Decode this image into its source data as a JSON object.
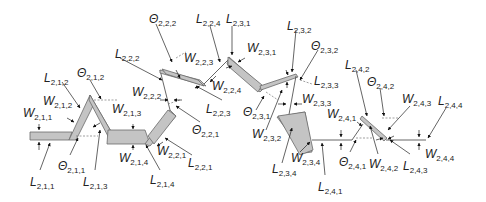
{
  "diagram": {
    "colors": {
      "segment_fill": "#c4c4c4",
      "segment_stroke": "#6a6a6a",
      "annotation": "#222222"
    },
    "labels": [
      {
        "id": "L211",
        "sym": "L",
        "sub": "2,1,1",
        "x": 30,
        "y": 176
      },
      {
        "id": "W211",
        "sym": "W",
        "sub": "2,1,1",
        "x": 23,
        "y": 107
      },
      {
        "id": "L212",
        "sym": "L",
        "sub": "2,1,2",
        "x": 44,
        "y": 72
      },
      {
        "id": "W212",
        "sym": "W",
        "sub": "2,1,2",
        "x": 43,
        "y": 95
      },
      {
        "id": "T212",
        "sym": "Θ",
        "sub": "2,1,2",
        "x": 77,
        "y": 67
      },
      {
        "id": "T211",
        "sym": "Θ",
        "sub": "2,1,1",
        "x": 58,
        "y": 160
      },
      {
        "id": "W213",
        "sym": "W",
        "sub": "2,1,3",
        "x": 112,
        "y": 103
      },
      {
        "id": "L213",
        "sym": "L",
        "sub": "2,1,3",
        "x": 83,
        "y": 176
      },
      {
        "id": "W214",
        "sym": "W",
        "sub": "2,1,4",
        "x": 119,
        "y": 152
      },
      {
        "id": "L214",
        "sym": "L",
        "sub": "2,1,4",
        "x": 150,
        "y": 174
      },
      {
        "id": "L222",
        "sym": "L",
        "sub": "2,2,2",
        "x": 115,
        "y": 48
      },
      {
        "id": "W222",
        "sym": "W",
        "sub": "2,2,2",
        "x": 132,
        "y": 86
      },
      {
        "id": "T222",
        "sym": "Θ",
        "sub": "2,2,2",
        "x": 149,
        "y": 13
      },
      {
        "id": "W223",
        "sym": "W",
        "sub": "2,2,3",
        "x": 184,
        "y": 52
      },
      {
        "id": "L224",
        "sym": "L",
        "sub": "2,2,4",
        "x": 196,
        "y": 13
      },
      {
        "id": "L231",
        "sym": "L",
        "sub": "2,3,1",
        "x": 226,
        "y": 13
      },
      {
        "id": "W224",
        "sym": "W",
        "sub": "2,2,4",
        "x": 212,
        "y": 80
      },
      {
        "id": "L223",
        "sym": "L",
        "sub": "2,2,3",
        "x": 206,
        "y": 103
      },
      {
        "id": "T221",
        "sym": "Θ",
        "sub": "2,2,1",
        "x": 192,
        "y": 124
      },
      {
        "id": "W221",
        "sym": "W",
        "sub": "2,2,1",
        "x": 157,
        "y": 145
      },
      {
        "id": "L221",
        "sym": "L",
        "sub": "2,2,1",
        "x": 188,
        "y": 157
      },
      {
        "id": "W231",
        "sym": "W",
        "sub": "2,3,1",
        "x": 247,
        "y": 42
      },
      {
        "id": "L232",
        "sym": "L",
        "sub": "2,3,2",
        "x": 287,
        "y": 20
      },
      {
        "id": "T232",
        "sym": "Θ",
        "sub": "2,3,2",
        "x": 311,
        "y": 40
      },
      {
        "id": "L233",
        "sym": "L",
        "sub": "2,3,3",
        "x": 314,
        "y": 75
      },
      {
        "id": "W233",
        "sym": "W",
        "sub": "2,3,3",
        "x": 302,
        "y": 93
      },
      {
        "id": "T231",
        "sym": "Θ",
        "sub": "2,3,1",
        "x": 243,
        "y": 106
      },
      {
        "id": "W232",
        "sym": "W",
        "sub": "2,3,2",
        "x": 252,
        "y": 128
      },
      {
        "id": "W234",
        "sym": "W",
        "sub": "2,3,4",
        "x": 291,
        "y": 152
      },
      {
        "id": "L234",
        "sym": "L",
        "sub": "2,3,4",
        "x": 272,
        "y": 163
      },
      {
        "id": "W241",
        "sym": "W",
        "sub": "2,4,1",
        "x": 327,
        "y": 108
      },
      {
        "id": "L241",
        "sym": "L",
        "sub": "2,4,1",
        "x": 318,
        "y": 181
      },
      {
        "id": "T241",
        "sym": "Θ",
        "sub": "2,4,1",
        "x": 339,
        "y": 156
      },
      {
        "id": "L242",
        "sym": "L",
        "sub": "2,4,2",
        "x": 345,
        "y": 59
      },
      {
        "id": "T242",
        "sym": "Θ",
        "sub": "2,4,2",
        "x": 367,
        "y": 76
      },
      {
        "id": "W242",
        "sym": "W",
        "sub": "2,4,2",
        "x": 369,
        "y": 158
      },
      {
        "id": "L243",
        "sym": "L",
        "sub": "2,4,3",
        "x": 403,
        "y": 160
      },
      {
        "id": "W243",
        "sym": "W",
        "sub": "2,4,3",
        "x": 402,
        "y": 93
      },
      {
        "id": "L244",
        "sym": "L",
        "sub": "2,4,4",
        "x": 438,
        "y": 95
      },
      {
        "id": "W244",
        "sym": "W",
        "sub": "2,4,4",
        "x": 425,
        "y": 148
      }
    ]
  }
}
